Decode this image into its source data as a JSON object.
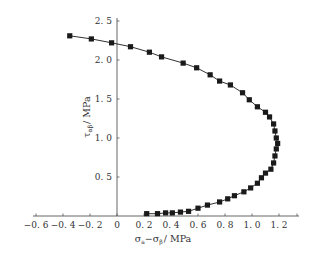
{
  "chart_data": {
    "type": "scatter",
    "title": "",
    "xlabel": "σa−σβ / MPa",
    "ylabel": "ταβ / MPa",
    "xlim": [
      -0.6,
      1.3
    ],
    "ylim": [
      0,
      2.5
    ],
    "x_ticks": [
      "-0.6",
      "-0.4",
      "-0.2",
      "0",
      "0.2",
      "0.4",
      "0.6",
      "0.8",
      "1.0",
      "1.2"
    ],
    "x_tick_values": [
      -0.6,
      -0.4,
      -0.2,
      0,
      0.2,
      0.4,
      0.6,
      0.8,
      1.0,
      1.2
    ],
    "y_ticks": [
      "0.5",
      "1.0",
      "1.5",
      "2.0",
      "2.5"
    ],
    "y_tick_values": [
      0.5,
      1.0,
      1.5,
      2.0,
      2.5
    ],
    "grid": false,
    "legend": null,
    "series": [
      {
        "name": "data",
        "marker": "square",
        "line": true,
        "color": "#1a1a1a",
        "x": [
          -0.35,
          -0.19,
          -0.04,
          0.1,
          0.24,
          0.33,
          0.49,
          0.59,
          0.69,
          0.76,
          0.84,
          0.93,
          0.98,
          1.04,
          1.1,
          1.13,
          1.16,
          1.17,
          1.18,
          1.19,
          1.18,
          1.17,
          1.16,
          1.14,
          1.1,
          1.07,
          1.04,
          0.99,
          0.94,
          0.87,
          0.82,
          0.76,
          0.67,
          0.6,
          0.53,
          0.47,
          0.41,
          0.36,
          0.3,
          0.22
        ],
        "y": [
          2.31,
          2.27,
          2.22,
          2.17,
          2.1,
          2.04,
          1.96,
          1.9,
          1.81,
          1.73,
          1.68,
          1.58,
          1.49,
          1.4,
          1.33,
          1.27,
          1.18,
          1.09,
          1.0,
          0.93,
          0.86,
          0.77,
          0.68,
          0.6,
          0.55,
          0.49,
          0.42,
          0.36,
          0.31,
          0.26,
          0.22,
          0.18,
          0.14,
          0.1,
          0.06,
          0.05,
          0.04,
          0.04,
          0.03,
          0.03
        ]
      }
    ]
  },
  "labels": {
    "xlabel_main": "σ",
    "xlabel_sub1": "a",
    "xlabel_mid": "−σ",
    "xlabel_sub2": "β",
    "xlabel_unit": "/ MPa",
    "ylabel_main": "τ",
    "ylabel_sub": "αβ",
    "ylabel_unit": "/ MPa"
  }
}
